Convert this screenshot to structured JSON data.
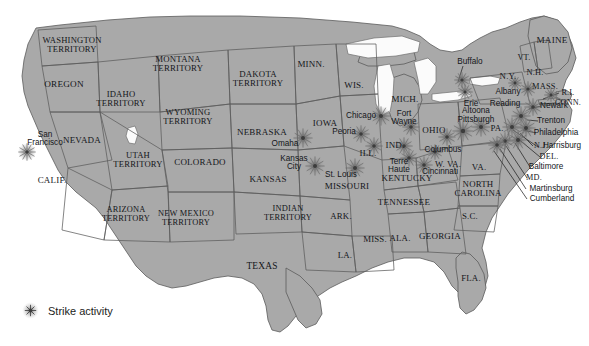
{
  "map": {
    "title": "United States strike activity map",
    "era_note": "Territories era map of the United States",
    "colors": {
      "land": "#a9a9a9",
      "land_dark": "#9a9a9a",
      "border": "#5c5c5c",
      "background": "#ffffff",
      "label": "#14161a",
      "strike_marker": "#6b6b6b",
      "leader_line": "#2a2a2a"
    },
    "legend": {
      "label": "Strike activity",
      "marker_icon": "strike-burst-icon",
      "x": 40,
      "y": 312
    },
    "states": [
      {
        "name": "WASHINGTON\nTERRITORY",
        "x": 72,
        "y": 45,
        "size": 8.6
      },
      {
        "name": "OREGON",
        "x": 64,
        "y": 85,
        "size": 9.2
      },
      {
        "name": "IDAHO\nTERRITORY",
        "x": 121,
        "y": 99,
        "size": 8.6
      },
      {
        "name": "MONTANA\nTERRITORY",
        "x": 178,
        "y": 64,
        "size": 8.8
      },
      {
        "name": "WYOMING\nTERRITORY",
        "x": 188,
        "y": 117,
        "size": 8.6
      },
      {
        "name": "NEVADA",
        "x": 82,
        "y": 141,
        "size": 9.0
      },
      {
        "name": "CALIF.",
        "x": 52,
        "y": 181,
        "size": 9.0
      },
      {
        "name": "UTAH\nTERRITORY",
        "x": 138,
        "y": 160,
        "size": 8.6
      },
      {
        "name": "COLORADO",
        "x": 200,
        "y": 163,
        "size": 9.0
      },
      {
        "name": "ARIZONA\nTERRITORY",
        "x": 126,
        "y": 215,
        "size": 8.4
      },
      {
        "name": "NEW MEXICO\nTERRITORY",
        "x": 186,
        "y": 219,
        "size": 8.4
      },
      {
        "name": "DAKOTA\nTERRITORY",
        "x": 258,
        "y": 79,
        "size": 8.8
      },
      {
        "name": "NEBRASKA",
        "x": 262,
        "y": 133,
        "size": 9.0
      },
      {
        "name": "KANSAS",
        "x": 268,
        "y": 180,
        "size": 9.0
      },
      {
        "name": "INDIAN\nTERRITORY",
        "x": 288,
        "y": 214,
        "size": 8.4
      },
      {
        "name": "TEXAS",
        "x": 262,
        "y": 267,
        "size": 9.4
      },
      {
        "name": "MINN.",
        "x": 311,
        "y": 65,
        "size": 9.0
      },
      {
        "name": "IOWA",
        "x": 325,
        "y": 124,
        "size": 9.0
      },
      {
        "name": "MISSOURI",
        "x": 347,
        "y": 187,
        "size": 9.0
      },
      {
        "name": "ARK.",
        "x": 341,
        "y": 216,
        "size": 8.8
      },
      {
        "name": "LA.",
        "x": 345,
        "y": 255,
        "size": 8.8
      },
      {
        "name": "WIS.",
        "x": 354,
        "y": 86,
        "size": 9.0
      },
      {
        "name": "ILL.",
        "x": 368,
        "y": 154,
        "size": 9.0
      },
      {
        "name": "MISS.",
        "x": 375,
        "y": 239,
        "size": 8.8
      },
      {
        "name": "IND.",
        "x": 395,
        "y": 146,
        "size": 9.0
      },
      {
        "name": "MICH.",
        "x": 405,
        "y": 100,
        "size": 9.0
      },
      {
        "name": "KENTUCKY",
        "x": 407,
        "y": 179,
        "size": 9.0
      },
      {
        "name": "TENNESSEE",
        "x": 404,
        "y": 203,
        "size": 9.0
      },
      {
        "name": "ALA.",
        "x": 400,
        "y": 238,
        "size": 8.8
      },
      {
        "name": "GEORGIA",
        "x": 440,
        "y": 237,
        "size": 9.0
      },
      {
        "name": "FLA.",
        "x": 471,
        "y": 278,
        "size": 8.8
      },
      {
        "name": "OHIO",
        "x": 434,
        "y": 131,
        "size": 9.0
      },
      {
        "name": "W. VA.",
        "x": 448,
        "y": 164,
        "size": 8.6
      },
      {
        "name": "VA.",
        "x": 479,
        "y": 168,
        "size": 9.0
      },
      {
        "name": "NORTH\nCAROLINA",
        "x": 478,
        "y": 189,
        "size": 8.8
      },
      {
        "name": "S.C.",
        "x": 470,
        "y": 216,
        "size": 8.8
      },
      {
        "name": "PA.",
        "x": 497,
        "y": 128,
        "size": 8.8
      },
      {
        "name": "N.Y.",
        "x": 508,
        "y": 76,
        "size": 8.8
      },
      {
        "name": "VT.",
        "x": 524,
        "y": 58,
        "size": 8.4
      },
      {
        "name": "N.H.",
        "x": 535,
        "y": 73,
        "size": 8.4
      },
      {
        "name": "MAINE",
        "x": 552,
        "y": 41,
        "size": 9.2
      },
      {
        "name": "MASS.",
        "x": 545,
        "y": 87,
        "size": 8.4
      },
      {
        "name": "R.I.",
        "x": 568,
        "y": 93,
        "size": 8.2
      },
      {
        "name": "CONN.",
        "x": 568,
        "y": 103,
        "size": 8.2
      },
      {
        "name": "N.J.",
        "x": 541,
        "y": 146,
        "size": 8.2
      },
      {
        "name": "DEL.",
        "x": 549,
        "y": 157,
        "size": 8.2
      },
      {
        "name": "MD.",
        "x": 534,
        "y": 178,
        "size": 8.2
      }
    ],
    "cities": [
      {
        "name": "San\nFrancisco",
        "x": 45,
        "y": 139,
        "size": 8.2
      },
      {
        "name": "Omaha",
        "x": 285,
        "y": 144,
        "size": 8.2
      },
      {
        "name": "Kansas\nCity",
        "x": 294,
        "y": 163,
        "size": 8.2
      },
      {
        "name": "St. Louis",
        "x": 341,
        "y": 175,
        "size": 8.2
      },
      {
        "name": "Chicago",
        "x": 361,
        "y": 116,
        "size": 8.2
      },
      {
        "name": "Peoria",
        "x": 344,
        "y": 132,
        "size": 8.2
      },
      {
        "name": "Terre\nHaute",
        "x": 399,
        "y": 166,
        "size": 8.2
      },
      {
        "name": "Cincinnati",
        "x": 440,
        "y": 172,
        "size": 8.2
      },
      {
        "name": "Columbus",
        "x": 443,
        "y": 150,
        "size": 8.2
      },
      {
        "name": "Fort\nWayne",
        "x": 404,
        "y": 118,
        "size": 8.2
      },
      {
        "name": "Pittsburgh",
        "x": 476,
        "y": 120,
        "size": 8.2
      },
      {
        "name": "Altoona",
        "x": 476,
        "y": 111,
        "size": 8.2
      },
      {
        "name": "Erie",
        "x": 471,
        "y": 104,
        "size": 8.2
      },
      {
        "name": "Reading",
        "x": 505,
        "y": 104,
        "size": 8.2
      },
      {
        "name": "Buffalo",
        "x": 470,
        "y": 62,
        "size": 8.2
      },
      {
        "name": "Albany",
        "x": 508,
        "y": 92,
        "size": 8.2
      },
      {
        "name": "Newark",
        "x": 554,
        "y": 106,
        "size": 8.2
      },
      {
        "name": "Trenton",
        "x": 551,
        "y": 121,
        "size": 8.2
      },
      {
        "name": "Philadelphia",
        "x": 556,
        "y": 133,
        "size": 8.2
      },
      {
        "name": "Harrisburg",
        "x": 562,
        "y": 146,
        "size": 8.2
      },
      {
        "name": "Baltimore",
        "x": 546,
        "y": 167,
        "size": 8.2
      },
      {
        "name": "Martinsburg",
        "x": 551,
        "y": 189,
        "size": 8.2
      },
      {
        "name": "Cumberland",
        "x": 552,
        "y": 199,
        "size": 8.2
      }
    ],
    "strike_markers": [
      {
        "place": "San Francisco",
        "x": 27,
        "y": 152,
        "r": 9
      },
      {
        "place": "Omaha",
        "x": 303,
        "y": 138,
        "r": 10
      },
      {
        "place": "Kansas City",
        "x": 315,
        "y": 166,
        "r": 10
      },
      {
        "place": "St. Louis",
        "x": 355,
        "y": 168,
        "r": 10
      },
      {
        "place": "Chicago",
        "x": 381,
        "y": 116,
        "r": 10
      },
      {
        "place": "Peoria",
        "x": 361,
        "y": 134,
        "r": 9
      },
      {
        "place": "Illinois",
        "x": 374,
        "y": 146,
        "r": 9
      },
      {
        "place": "Terre Haute",
        "x": 409,
        "y": 158,
        "r": 9
      },
      {
        "place": "Cincinnati",
        "x": 424,
        "y": 165,
        "r": 9
      },
      {
        "place": "Indiana",
        "x": 404,
        "y": 146,
        "r": 9
      },
      {
        "place": "Fort Wayne",
        "x": 411,
        "y": 127,
        "r": 9
      },
      {
        "place": "Columbus",
        "x": 435,
        "y": 152,
        "r": 8
      },
      {
        "place": "Ohio",
        "x": 447,
        "y": 137,
        "r": 9
      },
      {
        "place": "Pittsburgh",
        "x": 463,
        "y": 131,
        "r": 11
      },
      {
        "place": "Altoona",
        "x": 481,
        "y": 127,
        "r": 10
      },
      {
        "place": "Erie",
        "x": 465,
        "y": 92,
        "r": 8
      },
      {
        "place": "Buffalo",
        "x": 462,
        "y": 80,
        "r": 8
      },
      {
        "place": "Albany",
        "x": 528,
        "y": 89,
        "r": 8
      },
      {
        "place": "Reading",
        "x": 521,
        "y": 116,
        "r": 10
      },
      {
        "place": "Newark",
        "x": 533,
        "y": 107,
        "r": 9
      },
      {
        "place": "Philadelphia",
        "x": 526,
        "y": 128,
        "r": 10
      },
      {
        "place": "Harrisburg",
        "x": 512,
        "y": 127,
        "r": 10
      },
      {
        "place": "Baltimore",
        "x": 518,
        "y": 140,
        "r": 10
      },
      {
        "place": "Martinsburg",
        "x": 505,
        "y": 141,
        "r": 9
      },
      {
        "place": "Cumberland",
        "x": 497,
        "y": 145,
        "r": 9
      },
      {
        "place": "Mass.",
        "x": 551,
        "y": 95,
        "r": 7
      },
      {
        "place": "New York",
        "x": 515,
        "y": 83,
        "r": 7
      }
    ],
    "leader_lines": [
      {
        "label": "Buffalo",
        "x1": 463,
        "y1": 66,
        "x2": 458,
        "y2": 82
      },
      {
        "label": "R.I.",
        "x1": 559,
        "y1": 93,
        "x2": 543,
        "y2": 99
      },
      {
        "label": "CONN.",
        "x1": 556,
        "y1": 103,
        "x2": 539,
        "y2": 104
      },
      {
        "label": "Newark",
        "x1": 541,
        "y1": 106,
        "x2": 529,
        "y2": 109
      },
      {
        "label": "Trenton",
        "x1": 538,
        "y1": 121,
        "x2": 527,
        "y2": 120
      },
      {
        "label": "Philadelphia",
        "x1": 536,
        "y1": 133,
        "x2": 523,
        "y2": 130
      },
      {
        "label": "N.J.",
        "x1": 533,
        "y1": 146,
        "x2": 520,
        "y2": 133
      },
      {
        "label": "Harrisburg",
        "x1": 538,
        "y1": 147,
        "x2": 513,
        "y2": 130
      },
      {
        "label": "DEL.",
        "x1": 540,
        "y1": 157,
        "x2": 516,
        "y2": 137
      },
      {
        "label": "Baltimore",
        "x1": 530,
        "y1": 167,
        "x2": 515,
        "y2": 143
      },
      {
        "label": "MD.",
        "x1": 527,
        "y1": 178,
        "x2": 506,
        "y2": 146
      },
      {
        "label": "Martinsburg",
        "x1": 526,
        "y1": 189,
        "x2": 500,
        "y2": 149
      },
      {
        "label": "Cumberland",
        "x1": 527,
        "y1": 199,
        "x2": 494,
        "y2": 151
      }
    ]
  }
}
